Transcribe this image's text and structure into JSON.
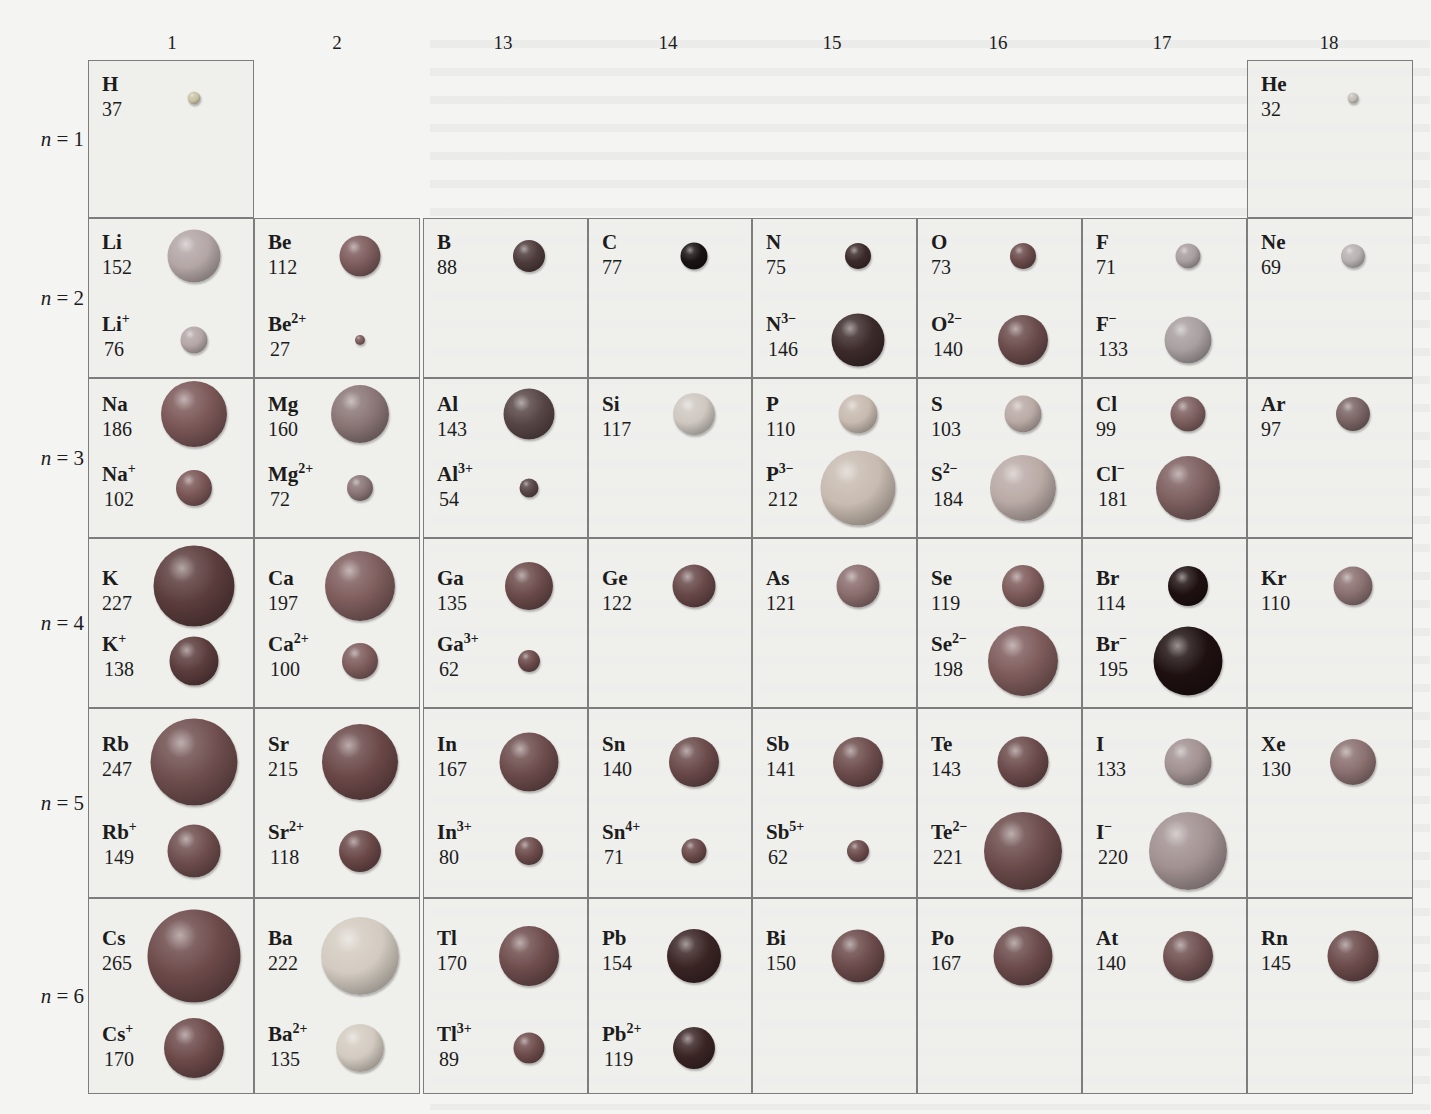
{
  "figure": {
    "group_labels": [
      "1",
      "2",
      "13",
      "14",
      "15",
      "16",
      "17",
      "18"
    ],
    "period_labels": [
      {
        "n": "n",
        "eq": " = ",
        "num": "1"
      },
      {
        "n": "n",
        "eq": " = ",
        "num": "2"
      },
      {
        "n": "n",
        "eq": " = ",
        "num": "3"
      },
      {
        "n": "n",
        "eq": " = ",
        "num": "4"
      },
      {
        "n": "n",
        "eq": " = ",
        "num": "5"
      },
      {
        "n": "n",
        "eq": " = ",
        "num": "6"
      }
    ]
  },
  "colors": {
    "border": "#7d7d7d",
    "cell_bg": "#eeeeec",
    "page_bg": "#f4f4f3"
  },
  "chart_data": {
    "type": "table",
    "columns": [
      "1",
      "2",
      "13",
      "14",
      "15",
      "16",
      "17",
      "18"
    ],
    "rows": [
      "n = 1",
      "n = 2",
      "n = 3",
      "n = 4",
      "n = 5",
      "n = 6"
    ],
    "entries": [
      {
        "period": 1,
        "group": "1",
        "atom": "H",
        "atom_radius": 37
      },
      {
        "period": 1,
        "group": "18",
        "atom": "He",
        "atom_radius": 32
      },
      {
        "period": 2,
        "group": "1",
        "atom": "Li",
        "atom_radius": 152,
        "ion": "Li+",
        "ion_radius": 76
      },
      {
        "period": 2,
        "group": "2",
        "atom": "Be",
        "atom_radius": 112,
        "ion": "Be2+",
        "ion_radius": 27
      },
      {
        "period": 2,
        "group": "13",
        "atom": "B",
        "atom_radius": 88
      },
      {
        "period": 2,
        "group": "14",
        "atom": "C",
        "atom_radius": 77
      },
      {
        "period": 2,
        "group": "15",
        "atom": "N",
        "atom_radius": 75,
        "ion": "N3-",
        "ion_radius": 146
      },
      {
        "period": 2,
        "group": "16",
        "atom": "O",
        "atom_radius": 73,
        "ion": "O2-",
        "ion_radius": 140
      },
      {
        "period": 2,
        "group": "17",
        "atom": "F",
        "atom_radius": 71,
        "ion": "F-",
        "ion_radius": 133
      },
      {
        "period": 2,
        "group": "18",
        "atom": "Ne",
        "atom_radius": 69
      },
      {
        "period": 3,
        "group": "1",
        "atom": "Na",
        "atom_radius": 186,
        "ion": "Na+",
        "ion_radius": 102
      },
      {
        "period": 3,
        "group": "2",
        "atom": "Mg",
        "atom_radius": 160,
        "ion": "Mg2+",
        "ion_radius": 72
      },
      {
        "period": 3,
        "group": "13",
        "atom": "Al",
        "atom_radius": 143,
        "ion": "Al3+",
        "ion_radius": 54
      },
      {
        "period": 3,
        "group": "14",
        "atom": "Si",
        "atom_radius": 117
      },
      {
        "period": 3,
        "group": "15",
        "atom": "P",
        "atom_radius": 110,
        "ion": "P3-",
        "ion_radius": 212
      },
      {
        "period": 3,
        "group": "16",
        "atom": "S",
        "atom_radius": 103,
        "ion": "S2-",
        "ion_radius": 184
      },
      {
        "period": 3,
        "group": "17",
        "atom": "Cl",
        "atom_radius": 99,
        "ion": "Cl-",
        "ion_radius": 181
      },
      {
        "period": 3,
        "group": "18",
        "atom": "Ar",
        "atom_radius": 97
      },
      {
        "period": 4,
        "group": "1",
        "atom": "K",
        "atom_radius": 227,
        "ion": "K+",
        "ion_radius": 138
      },
      {
        "period": 4,
        "group": "2",
        "atom": "Ca",
        "atom_radius": 197,
        "ion": "Ca2+",
        "ion_radius": 100
      },
      {
        "period": 4,
        "group": "13",
        "atom": "Ga",
        "atom_radius": 135,
        "ion": "Ga3+",
        "ion_radius": 62
      },
      {
        "period": 4,
        "group": "14",
        "atom": "Ge",
        "atom_radius": 122
      },
      {
        "period": 4,
        "group": "15",
        "atom": "As",
        "atom_radius": 121
      },
      {
        "period": 4,
        "group": "16",
        "atom": "Se",
        "atom_radius": 119,
        "ion": "Se2-",
        "ion_radius": 198
      },
      {
        "period": 4,
        "group": "17",
        "atom": "Br",
        "atom_radius": 114,
        "ion": "Br-",
        "ion_radius": 195
      },
      {
        "period": 4,
        "group": "18",
        "atom": "Kr",
        "atom_radius": 110
      },
      {
        "period": 5,
        "group": "1",
        "atom": "Rb",
        "atom_radius": 247,
        "ion": "Rb+",
        "ion_radius": 149
      },
      {
        "period": 5,
        "group": "2",
        "atom": "Sr",
        "atom_radius": 215,
        "ion": "Sr2+",
        "ion_radius": 118
      },
      {
        "period": 5,
        "group": "13",
        "atom": "In",
        "atom_radius": 167,
        "ion": "In3+",
        "ion_radius": 80
      },
      {
        "period": 5,
        "group": "14",
        "atom": "Sn",
        "atom_radius": 140,
        "ion": "Sn4+",
        "ion_radius": 71
      },
      {
        "period": 5,
        "group": "15",
        "atom": "Sb",
        "atom_radius": 141,
        "ion": "Sb5+",
        "ion_radius": 62
      },
      {
        "period": 5,
        "group": "16",
        "atom": "Te",
        "atom_radius": 143,
        "ion": "Te2-",
        "ion_radius": 221
      },
      {
        "period": 5,
        "group": "17",
        "atom": "I",
        "atom_radius": 133,
        "ion": "I-",
        "ion_radius": 220
      },
      {
        "period": 5,
        "group": "18",
        "atom": "Xe",
        "atom_radius": 130
      },
      {
        "period": 6,
        "group": "1",
        "atom": "Cs",
        "atom_radius": 265,
        "ion": "Cs+",
        "ion_radius": 170
      },
      {
        "period": 6,
        "group": "2",
        "atom": "Ba",
        "atom_radius": 222,
        "ion": "Ba2+",
        "ion_radius": 135
      },
      {
        "period": 6,
        "group": "13",
        "atom": "Tl",
        "atom_radius": 170,
        "ion": "Tl3+",
        "ion_radius": 89
      },
      {
        "period": 6,
        "group": "14",
        "atom": "Pb",
        "atom_radius": 154,
        "ion": "Pb2+",
        "ion_radius": 119
      },
      {
        "period": 6,
        "group": "15",
        "atom": "Bi",
        "atom_radius": 150
      },
      {
        "period": 6,
        "group": "16",
        "atom": "Po",
        "atom_radius": 167
      },
      {
        "period": 6,
        "group": "17",
        "atom": "At",
        "atom_radius": 140
      },
      {
        "period": 6,
        "group": "18",
        "atom": "Rn",
        "atom_radius": 145
      }
    ]
  },
  "cells": [
    {
      "id": "H",
      "col": 0,
      "row": 0,
      "a": {
        "el": "H",
        "sup": "",
        "r": "37",
        "d": 13,
        "color": "#c9c3a6"
      }
    },
    {
      "id": "He",
      "col": 7,
      "row": 0,
      "a": {
        "el": "He",
        "sup": "",
        "r": "32",
        "d": 11,
        "color": "#c3bfb8"
      }
    },
    {
      "id": "Li",
      "col": 0,
      "row": 1,
      "a": {
        "el": "Li",
        "sup": "",
        "r": "152",
        "d": 53,
        "color": "#b3a6a5"
      },
      "i": {
        "el": "Li",
        "sup": "+",
        "r": "76",
        "d": 27,
        "color": "#b3a6a5"
      }
    },
    {
      "id": "Be",
      "col": 1,
      "row": 1,
      "a": {
        "el": "Be",
        "sup": "",
        "r": "112",
        "d": 41,
        "color": "#7d5c5c"
      },
      "i": {
        "el": "Be",
        "sup": "2+",
        "r": "27",
        "d": 10,
        "color": "#7d5c5c"
      }
    },
    {
      "id": "B",
      "col": 2,
      "row": 1,
      "a": {
        "el": "B",
        "sup": "",
        "r": "88",
        "d": 32,
        "color": "#4d3b3b"
      }
    },
    {
      "id": "C",
      "col": 3,
      "row": 1,
      "a": {
        "el": "C",
        "sup": "",
        "r": "77",
        "d": 27,
        "color": "#191313"
      }
    },
    {
      "id": "N",
      "col": 4,
      "row": 1,
      "a": {
        "el": "N",
        "sup": "",
        "r": "75",
        "d": 26,
        "color": "#3c2a2a"
      },
      "i": {
        "el": "N",
        "sup": "3−",
        "r": "146",
        "d": 53,
        "color": "#3c2a2a"
      }
    },
    {
      "id": "O",
      "col": 5,
      "row": 1,
      "a": {
        "el": "O",
        "sup": "",
        "r": "73",
        "d": 26,
        "color": "#6a4a4a"
      },
      "i": {
        "el": "O",
        "sup": "2−",
        "r": "140",
        "d": 50,
        "color": "#6a4a4a"
      }
    },
    {
      "id": "F",
      "col": 6,
      "row": 1,
      "a": {
        "el": "F",
        "sup": "",
        "r": "71",
        "d": 25,
        "color": "#a89f9f"
      },
      "i": {
        "el": "F",
        "sup": "−",
        "r": "133",
        "d": 47,
        "color": "#a89f9f"
      }
    },
    {
      "id": "Ne",
      "col": 7,
      "row": 1,
      "a": {
        "el": "Ne",
        "sup": "",
        "r": "69",
        "d": 24,
        "color": "#b8b1b1"
      }
    },
    {
      "id": "Na",
      "col": 0,
      "row": 2,
      "a": {
        "el": "Na",
        "sup": "",
        "r": "186",
        "d": 66,
        "color": "#7a5656"
      },
      "i": {
        "el": "Na",
        "sup": "+",
        "r": "102",
        "d": 36,
        "color": "#7a5656"
      }
    },
    {
      "id": "Mg",
      "col": 1,
      "row": 2,
      "a": {
        "el": "Mg",
        "sup": "",
        "r": "160",
        "d": 58,
        "color": "#8a7575"
      },
      "i": {
        "el": "Mg",
        "sup": "2+",
        "r": "72",
        "d": 26,
        "color": "#8a7575"
      }
    },
    {
      "id": "Al",
      "col": 2,
      "row": 2,
      "a": {
        "el": "Al",
        "sup": "",
        "r": "143",
        "d": 51,
        "color": "#574545"
      },
      "i": {
        "el": "Al",
        "sup": "3+",
        "r": "54",
        "d": 19,
        "color": "#574545"
      }
    },
    {
      "id": "Si",
      "col": 3,
      "row": 2,
      "a": {
        "el": "Si",
        "sup": "",
        "r": "117",
        "d": 42,
        "color": "#cfc8c1"
      }
    },
    {
      "id": "P",
      "col": 4,
      "row": 2,
      "a": {
        "el": "P",
        "sup": "",
        "r": "110",
        "d": 39,
        "color": "#c8bbb0"
      },
      "i": {
        "el": "P",
        "sup": "3−",
        "r": "212",
        "d": 75,
        "color": "#c8bbb0"
      }
    },
    {
      "id": "S",
      "col": 5,
      "row": 2,
      "a": {
        "el": "S",
        "sup": "",
        "r": "103",
        "d": 37,
        "color": "#b9aaa5"
      },
      "i": {
        "el": "S",
        "sup": "2−",
        "r": "184",
        "d": 66,
        "color": "#b9aaa5"
      }
    },
    {
      "id": "Cl",
      "col": 6,
      "row": 2,
      "a": {
        "el": "Cl",
        "sup": "",
        "r": "99",
        "d": 35,
        "color": "#7d5f5f"
      },
      "i": {
        "el": "Cl",
        "sup": "−",
        "r": "181",
        "d": 64,
        "color": "#7d5f5f"
      }
    },
    {
      "id": "Ar",
      "col": 7,
      "row": 2,
      "a": {
        "el": "Ar",
        "sup": "",
        "r": "97",
        "d": 34,
        "color": "#7a6464"
      }
    },
    {
      "id": "K",
      "col": 0,
      "row": 3,
      "a": {
        "el": "K",
        "sup": "",
        "r": "227",
        "d": 81,
        "color": "#5b3c3c"
      },
      "i": {
        "el": "K",
        "sup": "+",
        "r": "138",
        "d": 49,
        "color": "#5b3c3c"
      }
    },
    {
      "id": "Ca",
      "col": 1,
      "row": 3,
      "a": {
        "el": "Ca",
        "sup": "",
        "r": "197",
        "d": 70,
        "color": "#7e5c5c"
      },
      "i": {
        "el": "Ca",
        "sup": "2+",
        "r": "100",
        "d": 36,
        "color": "#7e5c5c"
      }
    },
    {
      "id": "Ga",
      "col": 2,
      "row": 3,
      "a": {
        "el": "Ga",
        "sup": "",
        "r": "135",
        "d": 48,
        "color": "#6b4a4a"
      },
      "i": {
        "el": "Ga",
        "sup": "3+",
        "r": "62",
        "d": 22,
        "color": "#6b4a4a"
      }
    },
    {
      "id": "Ge",
      "col": 3,
      "row": 3,
      "a": {
        "el": "Ge",
        "sup": "",
        "r": "122",
        "d": 43,
        "color": "#674747"
      }
    },
    {
      "id": "As",
      "col": 4,
      "row": 3,
      "a": {
        "el": "As",
        "sup": "",
        "r": "121",
        "d": 43,
        "color": "#8a6d6d"
      }
    },
    {
      "id": "Se",
      "col": 5,
      "row": 3,
      "a": {
        "el": "Se",
        "sup": "",
        "r": "119",
        "d": 42,
        "color": "#7d5a5a"
      },
      "i": {
        "el": "Se",
        "sup": "2−",
        "r": "198",
        "d": 70,
        "color": "#7d5a5a"
      }
    },
    {
      "id": "Br",
      "col": 6,
      "row": 3,
      "a": {
        "el": "Br",
        "sup": "",
        "r": "114",
        "d": 40,
        "color": "#1e1010"
      },
      "i": {
        "el": "Br",
        "sup": "−",
        "r": "195",
        "d": 69,
        "color": "#1e1010"
      }
    },
    {
      "id": "Kr",
      "col": 7,
      "row": 3,
      "a": {
        "el": "Kr",
        "sup": "",
        "r": "110",
        "d": 39,
        "color": "#8a7070"
      }
    },
    {
      "id": "Rb",
      "col": 0,
      "row": 4,
      "a": {
        "el": "Rb",
        "sup": "",
        "r": "247",
        "d": 87,
        "color": "#6e4d4d"
      },
      "i": {
        "el": "Rb",
        "sup": "+",
        "r": "149",
        "d": 53,
        "color": "#6e4d4d"
      }
    },
    {
      "id": "Sr",
      "col": 1,
      "row": 4,
      "a": {
        "el": "Sr",
        "sup": "",
        "r": "215",
        "d": 76,
        "color": "#6a4747"
      },
      "i": {
        "el": "Sr",
        "sup": "2+",
        "r": "118",
        "d": 42,
        "color": "#6a4747"
      }
    },
    {
      "id": "In",
      "col": 2,
      "row": 4,
      "a": {
        "el": "In",
        "sup": "",
        "r": "167",
        "d": 59,
        "color": "#6c4b4b"
      },
      "i": {
        "el": "In",
        "sup": "3+",
        "r": "80",
        "d": 28,
        "color": "#6c4b4b"
      }
    },
    {
      "id": "Sn",
      "col": 3,
      "row": 4,
      "a": {
        "el": "Sn",
        "sup": "",
        "r": "140",
        "d": 50,
        "color": "#6a4949"
      },
      "i": {
        "el": "Sn",
        "sup": "4+",
        "r": "71",
        "d": 25,
        "color": "#6a4949"
      }
    },
    {
      "id": "Sb",
      "col": 4,
      "row": 4,
      "a": {
        "el": "Sb",
        "sup": "",
        "r": "141",
        "d": 50,
        "color": "#6d4c4c"
      },
      "i": {
        "el": "Sb",
        "sup": "5+",
        "r": "62",
        "d": 22,
        "color": "#6d4c4c"
      }
    },
    {
      "id": "Te",
      "col": 5,
      "row": 4,
      "a": {
        "el": "Te",
        "sup": "",
        "r": "143",
        "d": 51,
        "color": "#6b4a4a"
      },
      "i": {
        "el": "Te",
        "sup": "2−",
        "r": "221",
        "d": 78,
        "color": "#6b4a4a"
      }
    },
    {
      "id": "I",
      "col": 6,
      "row": 4,
      "a": {
        "el": "I",
        "sup": "",
        "r": "133",
        "d": 47,
        "color": "#a29191"
      },
      "i": {
        "el": "I",
        "sup": "−",
        "r": "220",
        "d": 78,
        "color": "#a29191"
      }
    },
    {
      "id": "Xe",
      "col": 7,
      "row": 4,
      "a": {
        "el": "Xe",
        "sup": "",
        "r": "130",
        "d": 46,
        "color": "#8b7070"
      }
    },
    {
      "id": "Cs",
      "col": 0,
      "row": 5,
      "a": {
        "el": "Cs",
        "sup": "",
        "r": "265",
        "d": 93,
        "color": "#6c4949"
      },
      "i": {
        "el": "Cs",
        "sup": "+",
        "r": "170",
        "d": 60,
        "color": "#6c4949"
      }
    },
    {
      "id": "Ba",
      "col": 1,
      "row": 5,
      "a": {
        "el": "Ba",
        "sup": "",
        "r": "222",
        "d": 78,
        "color": "#d3cbc1"
      },
      "i": {
        "el": "Ba",
        "sup": "2+",
        "r": "135",
        "d": 48,
        "color": "#d3cbc1"
      }
    },
    {
      "id": "Tl",
      "col": 2,
      "row": 5,
      "a": {
        "el": "Tl",
        "sup": "",
        "r": "170",
        "d": 60,
        "color": "#6e4c4c"
      },
      "i": {
        "el": "Tl",
        "sup": "3+",
        "r": "89",
        "d": 31,
        "color": "#6e4c4c"
      }
    },
    {
      "id": "Pb",
      "col": 3,
      "row": 5,
      "a": {
        "el": "Pb",
        "sup": "",
        "r": "154",
        "d": 54,
        "color": "#3a2424"
      },
      "i": {
        "el": "Pb",
        "sup": "2+",
        "r": "119",
        "d": 42,
        "color": "#3a2424"
      }
    },
    {
      "id": "Bi",
      "col": 4,
      "row": 5,
      "a": {
        "el": "Bi",
        "sup": "",
        "r": "150",
        "d": 53,
        "color": "#6b4a4a"
      }
    },
    {
      "id": "Po",
      "col": 5,
      "row": 5,
      "a": {
        "el": "Po",
        "sup": "",
        "r": "167",
        "d": 59,
        "color": "#6b4a4a"
      }
    },
    {
      "id": "At",
      "col": 6,
      "row": 5,
      "a": {
        "el": "At",
        "sup": "",
        "r": "140",
        "d": 50,
        "color": "#6f5050"
      }
    },
    {
      "id": "Rn",
      "col": 7,
      "row": 5,
      "a": {
        "el": "Rn",
        "sup": "",
        "r": "145",
        "d": 51,
        "color": "#6b4a4a"
      }
    }
  ]
}
